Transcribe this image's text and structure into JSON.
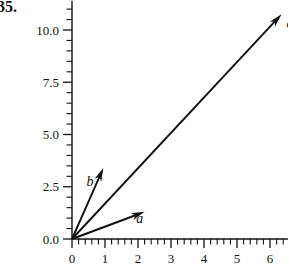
{
  "problem": {
    "number": "35."
  },
  "chart_data": {
    "type": "scatter",
    "subtype": "vector-diagram",
    "title": "",
    "xlabel": "",
    "ylabel": "",
    "xlim": [
      -0.25,
      6.55
    ],
    "ylim": [
      -0.45,
      11.4
    ],
    "grid": false,
    "legend": null,
    "axis_style": "two-spine-with-minor-ticks",
    "x_ticks": [
      0,
      1,
      2,
      3,
      4,
      5,
      6
    ],
    "x_tick_labels": [
      "0",
      "1",
      "2",
      "3",
      "4",
      "5",
      "6"
    ],
    "x_minor_per_major": 5,
    "y_ticks": [
      0.0,
      2.5,
      5.0,
      7.5,
      10.0
    ],
    "y_tick_labels": [
      "0.0",
      "2.5",
      "5.0",
      "7.5",
      "10.0"
    ],
    "y_minor_per_major": 5,
    "origin": [
      0,
      0
    ],
    "vectors": [
      {
        "name": "a",
        "label": "a",
        "tail": [
          0,
          0
        ],
        "tip": [
          2.2,
          1.3
        ],
        "label_pos": [
          1.95,
          0.78
        ],
        "color": "#111111"
      },
      {
        "name": "b",
        "label": "b",
        "tail": [
          0,
          0
        ],
        "tip": [
          0.95,
          3.4
        ],
        "label_pos": [
          0.44,
          2.55
        ],
        "color": "#111111"
      },
      {
        "name": "c",
        "label": "c",
        "tail": [
          0,
          0
        ],
        "tip": [
          6.35,
          10.75
        ],
        "label_pos": [
          6.5,
          10.1
        ],
        "color": "#111111"
      }
    ]
  }
}
